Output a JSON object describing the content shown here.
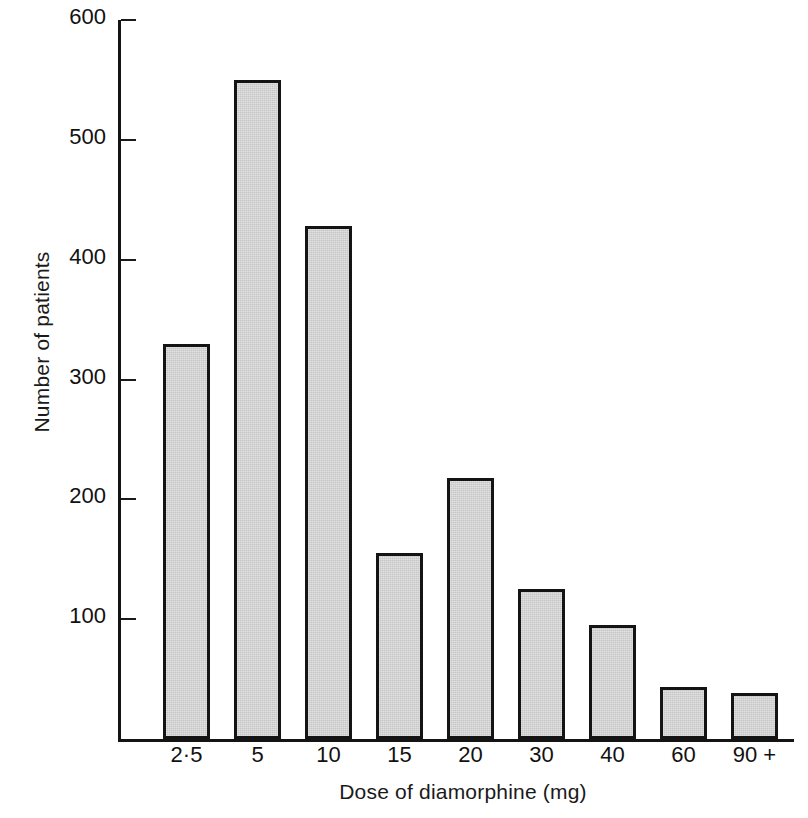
{
  "chart_data": {
    "type": "bar",
    "title": "",
    "xlabel": "Dose of diamorphine (mg)",
    "ylabel": "Number of patients",
    "categories": [
      "2·5",
      "5",
      "10",
      "15",
      "20",
      "30",
      "40",
      "60",
      "90 +"
    ],
    "values": [
      330,
      550,
      428,
      155,
      218,
      125,
      95,
      43,
      38
    ],
    "ylim": [
      0,
      600
    ],
    "yticks": [
      0,
      100,
      200,
      300,
      400,
      500,
      600
    ],
    "ytick_labels": [
      "",
      "100",
      "200",
      "300",
      "400",
      "500",
      "600"
    ],
    "grid": false,
    "legend": null,
    "bar_fill_color": "#c6c6c6",
    "bar_edge_color": "#141414",
    "axis_color": "#141414",
    "background_color": "#ffffff"
  },
  "axes": {
    "y_label": "Number of patients",
    "x_label": "Dose of diamorphine (mg)"
  }
}
